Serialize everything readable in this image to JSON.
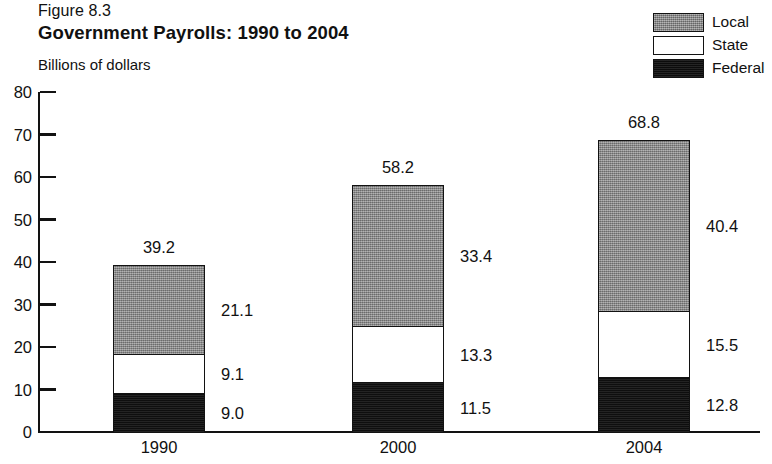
{
  "figure": {
    "number": "Figure 8.3",
    "title": "Government Payrolls: 1990 to 2004",
    "unit_label": "Billions of dollars"
  },
  "legend": {
    "position": "top-right",
    "items": [
      {
        "label": "Local",
        "swatch": "gray-hatched",
        "color": "#8b8b8b"
      },
      {
        "label": "State",
        "swatch": "white",
        "color": "#ffffff"
      },
      {
        "label": "Federal",
        "swatch": "black",
        "color": "#141414"
      }
    ]
  },
  "axes": {
    "y_ticks": [
      "80",
      "70",
      "60",
      "50",
      "40",
      "30",
      "20",
      "10",
      "0"
    ],
    "x_ticks": [
      "1990",
      "2000",
      "2004"
    ]
  },
  "chart_data": {
    "type": "bar",
    "stacked": true,
    "title": "Government Payrolls: 1990 to 2004",
    "subtitle": "Figure 8.3",
    "xlabel": "",
    "ylabel": "Billions of dollars",
    "ylim": [
      0,
      80
    ],
    "ytick_step": 10,
    "grid": false,
    "legend_position": "top-right",
    "categories": [
      "1990",
      "2000",
      "2004"
    ],
    "series": [
      {
        "name": "Federal",
        "color": "#141414",
        "values": [
          9.0,
          11.5,
          12.8
        ]
      },
      {
        "name": "State",
        "color": "#ffffff",
        "values": [
          9.1,
          13.3,
          15.5
        ]
      },
      {
        "name": "Local",
        "color": "#8b8b8b",
        "values": [
          21.1,
          33.4,
          40.4
        ]
      }
    ],
    "totals": [
      39.2,
      58.2,
      68.8
    ],
    "data_labels": {
      "1990": {
        "total": "39.2",
        "Local": "21.1",
        "State": "9.1",
        "Federal": "9.0"
      },
      "2000": {
        "total": "58.2",
        "Local": "33.4",
        "State": "13.3",
        "Federal": "11.5"
      },
      "2004": {
        "total": "68.8",
        "Local": "40.4",
        "State": "15.5",
        "Federal": "12.8"
      }
    }
  }
}
